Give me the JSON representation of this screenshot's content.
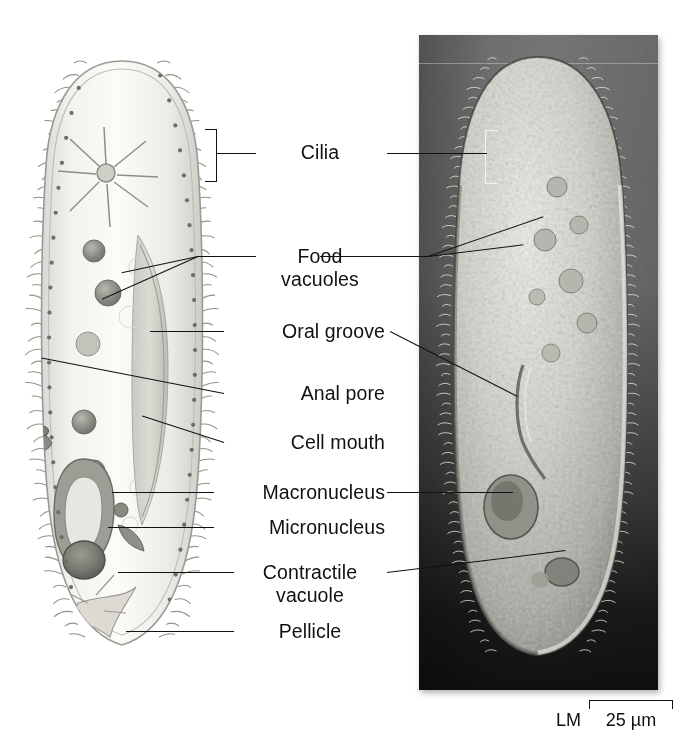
{
  "figure": {
    "panels": [
      {
        "name": "illustration",
        "type": "drawing",
        "caption": ""
      },
      {
        "name": "micrograph",
        "type": "light-micrograph",
        "caption": ""
      }
    ]
  },
  "labels": [
    {
      "id": "cilia",
      "text": "Cilia",
      "line2": "",
      "y": 152
    },
    {
      "id": "food-vacuoles",
      "text": "Food",
      "line2": "vacuoles",
      "y": 256
    },
    {
      "id": "oral-groove",
      "text": "Oral groove",
      "line2": "",
      "y": 331
    },
    {
      "id": "anal-pore",
      "text": "Anal pore",
      "line2": "",
      "y": 393
    },
    {
      "id": "cell-mouth",
      "text": "Cell mouth",
      "line2": "",
      "y": 442
    },
    {
      "id": "macronucleus",
      "text": "Macronucleus",
      "line2": "",
      "y": 492
    },
    {
      "id": "micronucleus",
      "text": "Micronucleus",
      "line2": "",
      "y": 527
    },
    {
      "id": "contractile-vacuole",
      "text": "Contractile",
      "line2": "vacuole",
      "y": 572
    },
    {
      "id": "pellicle",
      "text": "Pellicle",
      "line2": "",
      "y": 631
    }
  ],
  "scale": {
    "microscopy_type": "LM",
    "bar_value": "25 µm"
  },
  "colors": {
    "background": "#ffffff",
    "ink": "#111111",
    "micrograph_top": "#6d6d6d",
    "micrograph_bottom": "#0d0d0d",
    "bracket_white": "#f2f2f2"
  }
}
